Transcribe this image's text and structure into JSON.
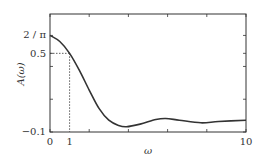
{
  "chart_data": {
    "type": "line",
    "title": "",
    "xlabel": "ω",
    "ylabel": "A(ω)",
    "xlim": [
      0,
      10
    ],
    "ylim": [
      -0.1,
      0.8
    ],
    "grid": false,
    "legend": null,
    "x_ticks": [
      0,
      2,
      4,
      6,
      8,
      10
    ],
    "x_tick_labels": [
      {
        "value": 0,
        "label": "0"
      },
      {
        "value": 1,
        "label": "1"
      },
      {
        "value": 10,
        "label": "10"
      }
    ],
    "y_ticks": [
      -0.1,
      0.15,
      0.4,
      0.5,
      0.6366
    ],
    "y_tick_labels": [
      {
        "value": 0.6366,
        "label": "2 / π"
      },
      {
        "value": 0.5,
        "label": "0.5"
      },
      {
        "value": -0.1,
        "label": "−0.1"
      }
    ],
    "series": [
      {
        "name": "A(ω)",
        "color": "#333333",
        "x": [
          0,
          0.5,
          1,
          1.5,
          2,
          2.5,
          3,
          3.5,
          3.9,
          4.6,
          5.4,
          5.9,
          6.6,
          7.7,
          8.6,
          10
        ],
        "y": [
          0.637,
          0.59,
          0.5,
          0.37,
          0.22,
          0.08,
          -0.01,
          -0.05,
          -0.06,
          -0.04,
          -0.005,
          0.003,
          -0.01,
          -0.03,
          -0.02,
          -0.01
        ]
      }
    ],
    "annotations": [
      {
        "type": "dotted-guide",
        "from": [
          0,
          0.5
        ],
        "to": [
          1,
          0.5
        ]
      },
      {
        "type": "dotted-guide",
        "from": [
          1,
          0.5
        ],
        "to": [
          1,
          -0.1
        ]
      }
    ]
  },
  "labels": {
    "xlabel": "ω",
    "ylabel": "A(ω)",
    "ytick_top": "2 / π",
    "ytick_mid": "0.5",
    "ytick_bottom": "−0.1",
    "xtick_0": "0",
    "xtick_1": "1",
    "xtick_10": "10"
  }
}
